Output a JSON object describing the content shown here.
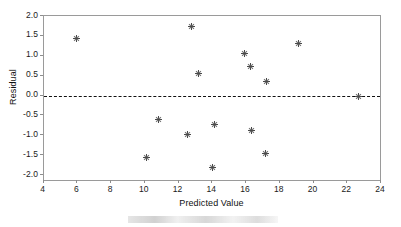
{
  "chart_data": {
    "type": "scatter",
    "title": "",
    "xlabel": "Predicted Value",
    "ylabel": "Residual",
    "xlim": [
      4,
      24
    ],
    "ylim": [
      -2.0,
      2.0
    ],
    "xticks": [
      "4",
      "6",
      "8",
      "10",
      "12",
      "14",
      "16",
      "18",
      "20",
      "22",
      "24"
    ],
    "xtick_values": [
      4,
      6,
      8,
      10,
      12,
      14,
      16,
      18,
      20,
      22,
      24
    ],
    "yticks": [
      "2.0",
      "1.5",
      "1.0",
      "0.5",
      "0.0",
      "-0.5",
      "-1.0",
      "-1.5",
      "-2.0"
    ],
    "ytick_values": [
      2.0,
      1.5,
      1.0,
      0.5,
      0.0,
      -0.5,
      -1.0,
      -1.5,
      -2.0
    ],
    "grid": false,
    "legend": false,
    "reference_line": {
      "axis": "y",
      "value": 0.0,
      "style": "dashed",
      "color": "#111111"
    },
    "marker": {
      "symbol": "asterisk",
      "color": "#4a4a4a",
      "size": 7
    },
    "points": [
      {
        "x": 5.96,
        "y": 1.44
      },
      {
        "x": 10.12,
        "y": -1.55
      },
      {
        "x": 10.79,
        "y": -0.61
      },
      {
        "x": 12.54,
        "y": -0.99
      },
      {
        "x": 12.78,
        "y": 1.73
      },
      {
        "x": 13.19,
        "y": 0.55
      },
      {
        "x": 14.02,
        "y": -1.81
      },
      {
        "x": 14.14,
        "y": -0.73
      },
      {
        "x": 15.9,
        "y": 1.05
      },
      {
        "x": 16.25,
        "y": 0.72
      },
      {
        "x": 16.35,
        "y": -0.88
      },
      {
        "x": 17.18,
        "y": -1.47
      },
      {
        "x": 17.22,
        "y": 0.36
      },
      {
        "x": 19.12,
        "y": 1.3
      },
      {
        "x": 22.65,
        "y": -0.03
      }
    ]
  },
  "colors": {
    "frame": "#9a9a9a",
    "marker": "#4a4a4a",
    "zero_line": "#111111",
    "text": "#111111",
    "background": "#ffffff"
  }
}
